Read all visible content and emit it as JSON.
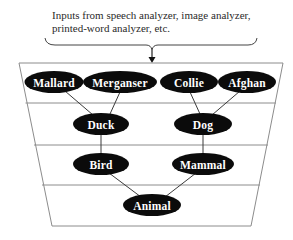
{
  "caption": {
    "line1": "Inputs from speech analyzer, image analyzer,",
    "line2": "printed-word analyzer, etc."
  },
  "diagram": {
    "levels": 4,
    "nodes": {
      "mallard": "Mallard",
      "merganser": "Merganser",
      "collie": "Collie",
      "afghan": "Afghan",
      "duck": "Duck",
      "dog": "Dog",
      "bird": "Bird",
      "mammal": "Mammal",
      "animal": "Animal"
    },
    "edges": [
      [
        "Mallard",
        "Duck"
      ],
      [
        "Merganser",
        "Duck"
      ],
      [
        "Collie",
        "Dog"
      ],
      [
        "Afghan",
        "Dog"
      ],
      [
        "Duck",
        "Bird"
      ],
      [
        "Dog",
        "Mammal"
      ],
      [
        "Bird",
        "Animal"
      ],
      [
        "Mammal",
        "Animal"
      ]
    ],
    "colors": {
      "node_fill": "#0b0b0b",
      "node_text": "#ffffff",
      "frame": "#8c8c8c",
      "edge": "#3a3a3a"
    }
  }
}
